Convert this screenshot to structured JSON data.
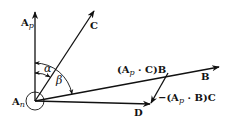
{
  "diagram": {
    "origin_label": "A",
    "origin_sub": "n",
    "vectors": {
      "ap": {
        "label": "A",
        "sub": "p"
      },
      "c": {
        "label": "C"
      },
      "b": {
        "label": "B"
      },
      "d": {
        "label": "D"
      },
      "apc_b": {
        "label_pre": "(A",
        "sub": "p",
        "label_post": " · C)B"
      },
      "apb_c": {
        "label_pre": "−(A",
        "sub": "p",
        "label_post": " · B)C"
      }
    },
    "angles": {
      "alpha": "α",
      "beta": "β"
    },
    "colors": {
      "stroke": "#111111",
      "background": "#ffffff"
    }
  }
}
